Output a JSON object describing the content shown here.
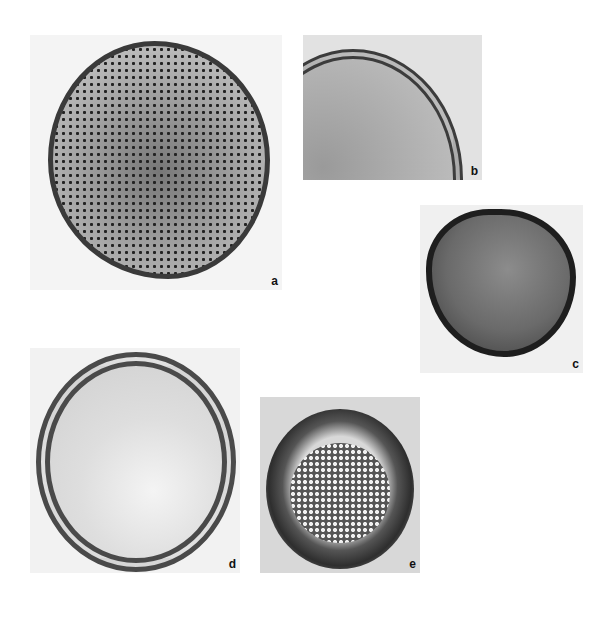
{
  "figure": {
    "panels": [
      {
        "label": "a"
      },
      {
        "label": "b"
      },
      {
        "label": "c"
      },
      {
        "label": "d"
      },
      {
        "label": "e"
      }
    ]
  }
}
